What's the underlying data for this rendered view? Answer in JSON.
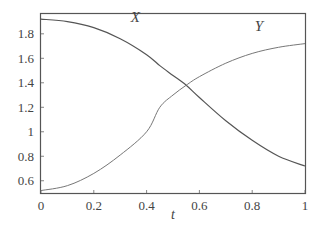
{
  "chart_data": {
    "type": "line",
    "title": "",
    "xlabel": "t",
    "ylabel": "",
    "xlim": [
      0,
      1
    ],
    "ylim": [
      0.5,
      1.97
    ],
    "grid": false,
    "legend": "none (inline curve labels)",
    "x_ticks": [
      "0",
      "0.2",
      "0.4",
      "0.6",
      "0.8",
      "1"
    ],
    "x_tick_values": [
      0,
      0.2,
      0.4,
      0.6,
      0.8,
      1
    ],
    "y_ticks": [
      "0.6",
      "0.8",
      "1",
      "1.2",
      "1.4",
      "1.6",
      "1.8"
    ],
    "y_tick_values": [
      0.6,
      0.8,
      1.0,
      1.2,
      1.4,
      1.6,
      1.8
    ],
    "x": [
      0,
      0.1,
      0.2,
      0.3,
      0.4,
      0.45,
      0.5,
      0.55,
      0.6,
      0.7,
      0.8,
      0.9,
      1.0
    ],
    "series": [
      {
        "name": "X",
        "label": "X",
        "label_pos": [
          0.34,
          1.9
        ],
        "values": [
          1.92,
          1.9,
          1.85,
          1.76,
          1.63,
          1.54,
          1.46,
          1.38,
          1.28,
          1.09,
          0.93,
          0.8,
          0.72
        ]
      },
      {
        "name": "Y",
        "label": "Y",
        "label_pos": [
          0.81,
          1.82
        ],
        "values": [
          0.52,
          0.56,
          0.66,
          0.81,
          1.0,
          1.2,
          1.3,
          1.38,
          1.45,
          1.56,
          1.64,
          1.69,
          1.72
        ]
      }
    ],
    "annotations": [
      {
        "text": "X",
        "near": "upper-left curve, t≈0.34"
      },
      {
        "text": "Y",
        "near": "upper-right curve, t≈0.81"
      }
    ]
  }
}
